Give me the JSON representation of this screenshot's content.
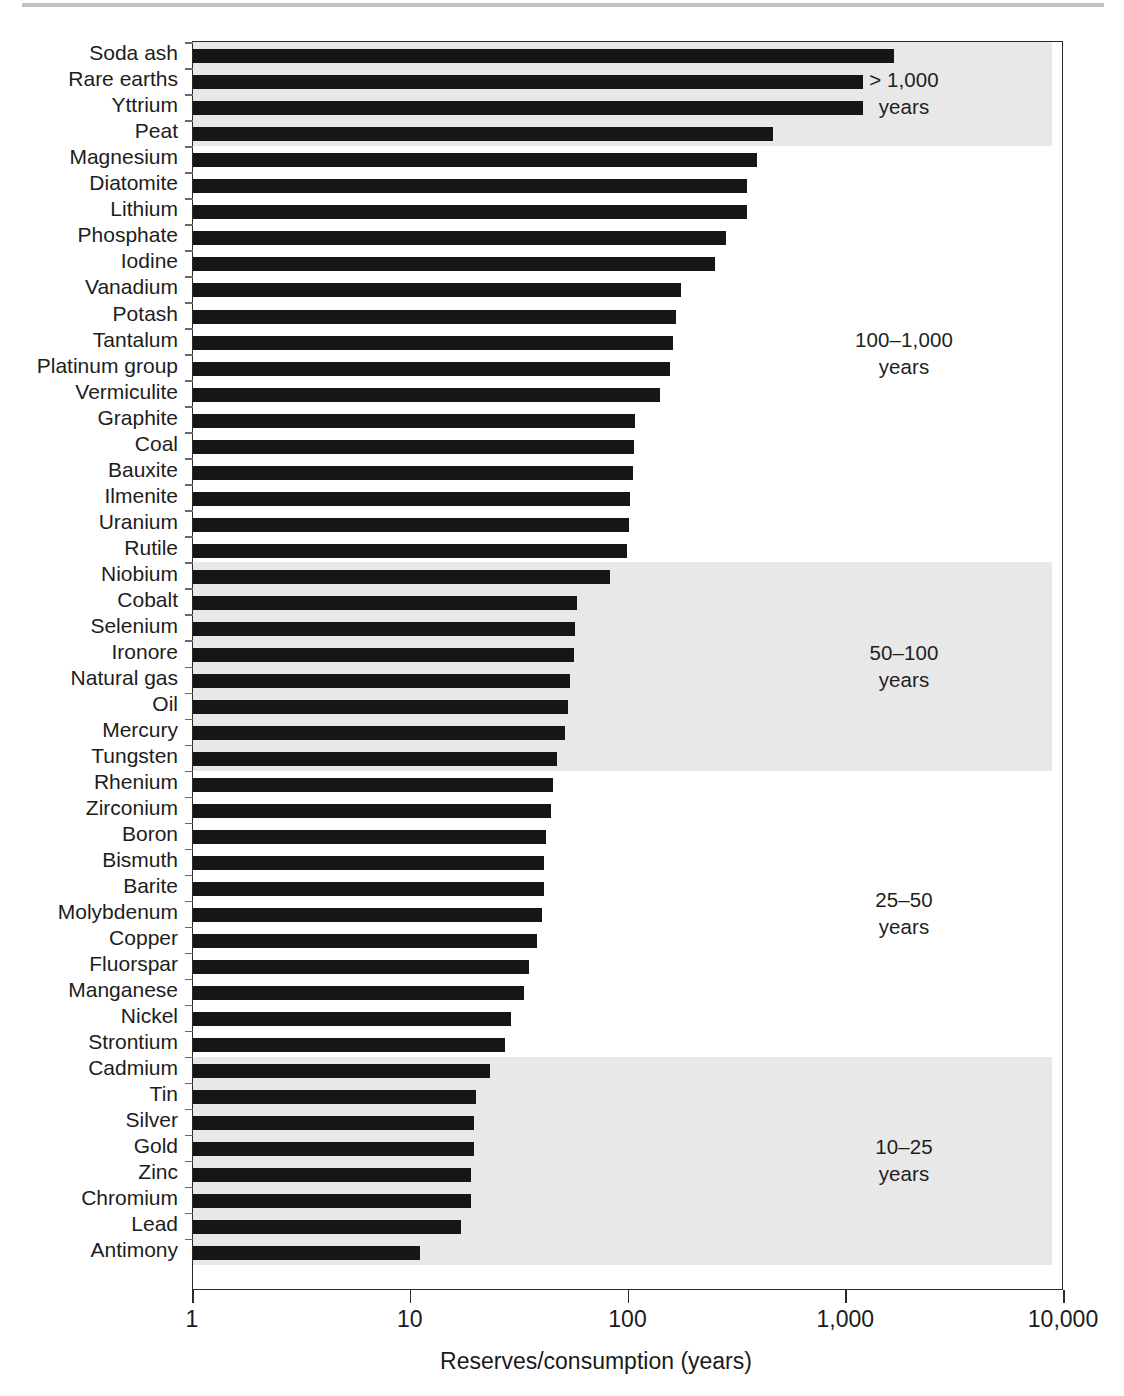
{
  "chart_data": {
    "type": "bar",
    "orientation": "horizontal",
    "title": "",
    "xlabel": "Reserves/consumption (years)",
    "ylabel": "",
    "xscale": "log",
    "xlim": [
      1,
      10000
    ],
    "xticks": [
      1,
      10,
      100,
      1000,
      10000
    ],
    "xtick_labels": [
      "1",
      "10",
      "100",
      "1,000",
      "10,000"
    ],
    "grid": false,
    "legend": "none",
    "categories": [
      "Soda ash",
      "Rare earths",
      "Yttrium",
      "Peat",
      "Magnesium",
      "Diatomite",
      "Lithium",
      "Phosphate",
      "Iodine",
      "Vanadium",
      "Potash",
      "Tantalum",
      "Platinum group",
      "Vermiculite",
      "Graphite",
      "Coal",
      "Bauxite",
      "Ilmenite",
      "Uranium",
      "Rutile",
      "Niobium",
      "Cobalt",
      "Selenium",
      "Ironore",
      "Natural gas",
      "Oil",
      "Mercury",
      "Tungsten",
      "Rhenium",
      "Zirconium",
      "Boron",
      "Bismuth",
      "Barite",
      "Molybdenum",
      "Copper",
      "Fluorspar",
      "Manganese",
      "Nickel",
      "Strontium",
      "Cadmium",
      "Tin",
      "Silver",
      "Gold",
      "Zinc",
      "Chromium",
      "Lead",
      "Antimony"
    ],
    "values": [
      1650,
      1200,
      1200,
      460,
      390,
      350,
      350,
      280,
      250,
      175,
      165,
      160,
      155,
      140,
      107,
      106,
      105,
      102,
      100,
      98,
      82,
      58,
      57,
      56,
      54,
      53,
      51,
      47,
      45,
      44,
      42,
      41,
      41,
      40,
      38,
      35,
      33,
      29,
      27,
      23,
      20,
      19.5,
      19.5,
      19,
      19,
      17,
      11
    ],
    "bands": [
      {
        "label": "> 1,000\nyears",
        "label_line1": "> 1,000",
        "label_line2": "years",
        "rows": [
          0,
          3
        ]
      },
      {
        "label": "100–1,000\nyears",
        "label_line1": "100–1,000",
        "label_line2": "years",
        "rows": [
          4,
          19
        ]
      },
      {
        "label": "50–100\nyears",
        "label_line1": "50–100",
        "label_line2": "years",
        "rows": [
          20,
          27
        ]
      },
      {
        "label": "25–50\nyears",
        "label_line1": "25–50",
        "label_line2": "years",
        "rows": [
          28,
          38
        ]
      },
      {
        "label": "10–25\nyears",
        "label_line1": "10–25",
        "label_line2": "years",
        "rows": [
          39,
          46
        ]
      }
    ],
    "shaded_band_indices": [
      0,
      2,
      4
    ],
    "colors": {
      "bar": "#161616",
      "band_shade": "#e8e8e8",
      "axis": "#2b2b2b",
      "text": "#1a1a1a",
      "background": "#ffffff"
    }
  },
  "axis": {
    "x_title": "Reserves/consumption (years)",
    "tick_labels": [
      "1",
      "10",
      "100",
      "1,000",
      "10,000"
    ]
  }
}
